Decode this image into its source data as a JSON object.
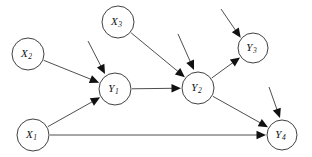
{
  "diagram": {
    "type": "directed-acyclic-graph",
    "background_color": "#ffffff",
    "node_stroke_color": "#2b2b2b",
    "node_fill_color": "#ffffff",
    "edge_color": "#3a3a3a",
    "arrow_color": "#111111",
    "nodes": [
      {
        "id": "X2",
        "base": "X",
        "sub": "2",
        "label": "X2",
        "cx": 28,
        "cy": 54,
        "r": 16,
        "role": "exogenous"
      },
      {
        "id": "X3",
        "base": "X",
        "sub": "3",
        "label": "X3",
        "cx": 118,
        "cy": 22,
        "r": 16,
        "role": "exogenous"
      },
      {
        "id": "X1",
        "base": "X",
        "sub": "1",
        "label": "X1",
        "cx": 33,
        "cy": 135,
        "r": 16,
        "role": "exogenous"
      },
      {
        "id": "Y1",
        "base": "Y",
        "sub": "1",
        "label": "Y1",
        "cx": 115,
        "cy": 89,
        "r": 16,
        "role": "endogenous"
      },
      {
        "id": "Y2",
        "base": "Y",
        "sub": "2",
        "label": "Y2",
        "cx": 198,
        "cy": 88,
        "r": 16,
        "role": "endogenous"
      },
      {
        "id": "Y3",
        "base": "Y",
        "sub": "3",
        "label": "Y3",
        "cx": 253,
        "cy": 48,
        "r": 15,
        "role": "endogenous"
      },
      {
        "id": "Y4",
        "base": "Y",
        "sub": "4",
        "label": "Y4",
        "cx": 282,
        "cy": 135,
        "r": 15,
        "role": "endogenous"
      }
    ],
    "edges": [
      {
        "id": "X2-Y1",
        "from": "X2",
        "to": "Y1",
        "label": ""
      },
      {
        "id": "X1-Y1",
        "from": "X1",
        "to": "Y1",
        "label": ""
      },
      {
        "id": "X3-Y2",
        "from": "X3",
        "to": "Y2",
        "label": ""
      },
      {
        "id": "Y1-Y2",
        "from": "Y1",
        "to": "Y2",
        "label": ""
      },
      {
        "id": "Y2-Y3",
        "from": "Y2",
        "to": "Y3",
        "label": ""
      },
      {
        "id": "Y2-Y4",
        "from": "Y2",
        "to": "Y4",
        "label": ""
      },
      {
        "id": "X1-Y4",
        "from": "X1",
        "to": "Y4",
        "label": ""
      }
    ],
    "disturbances": [
      {
        "id": "e-Y1",
        "target": "Y1",
        "x1": 88,
        "y1": 41,
        "x2": 105,
        "y2": 74
      },
      {
        "id": "e-Y2",
        "target": "Y2",
        "x1": 178,
        "y1": 34,
        "x2": 194,
        "y2": 70
      },
      {
        "id": "e-Y3",
        "target": "Y3",
        "x1": 221,
        "y1": 9,
        "x2": 241,
        "y2": 38
      },
      {
        "id": "e-Y4",
        "target": "Y4",
        "x1": 269,
        "y1": 87,
        "x2": 280,
        "y2": 118
      }
    ]
  }
}
